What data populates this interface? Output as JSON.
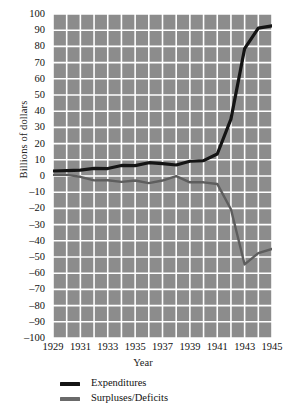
{
  "chart_data": {
    "type": "line",
    "title": "",
    "xlabel": "Year",
    "ylabel": "Billions of dollars",
    "xlim": [
      1929,
      1945
    ],
    "ylim": [
      -100,
      100
    ],
    "grid": true,
    "legend_position": "below-left",
    "background_color": "#8c8c8c",
    "gridline_color": "#ffffff",
    "x": [
      1929,
      1930,
      1931,
      1932,
      1933,
      1934,
      1935,
      1936,
      1937,
      1938,
      1939,
      1940,
      1941,
      1942,
      1943,
      1944,
      1945
    ],
    "x_tick_labels": [
      "1929",
      "1931",
      "1933",
      "1935",
      "1937",
      "1939",
      "1941",
      "1943",
      "1945"
    ],
    "x_tick_values": [
      1929,
      1931,
      1933,
      1935,
      1937,
      1939,
      1941,
      1943,
      1945
    ],
    "y_tick_labels": [
      "100",
      "90",
      "80",
      "70",
      "60",
      "50",
      "40",
      "30",
      "20",
      "10",
      "0",
      "–10",
      "–20",
      "–30",
      "–40",
      "–50",
      "–60",
      "–70",
      "–80",
      "–90",
      "–100"
    ],
    "y_tick_values": [
      100,
      90,
      80,
      70,
      60,
      50,
      40,
      30,
      20,
      10,
      0,
      -10,
      -20,
      -30,
      -40,
      -50,
      -60,
      -70,
      -80,
      -90,
      -100
    ],
    "series": [
      {
        "name": "Expenditures",
        "color": "#141414",
        "width": 3.2,
        "values": [
          3.1,
          3.3,
          3.6,
          4.7,
          4.6,
          6.5,
          6.4,
          8.2,
          7.6,
          6.8,
          9.1,
          9.5,
          13.6,
          35.1,
          78.6,
          91.3,
          92.7
        ]
      },
      {
        "name": "Surpluses/Deficits",
        "color": "#5e5e5e",
        "width": 2.4,
        "values": [
          0.7,
          0.7,
          -0.5,
          -2.7,
          -2.6,
          -3.6,
          -2.8,
          -4.4,
          -2.8,
          -0.1,
          -3.9,
          -3.9,
          -4.9,
          -20.5,
          -54.6,
          -47.6,
          -45.0
        ]
      }
    ]
  },
  "axes": {
    "y_title": "Billions of dollars",
    "x_title": "Year"
  },
  "legend": {
    "items": [
      {
        "label": "Expenditures",
        "color": "#141414"
      },
      {
        "label": "Surpluses/Deficits",
        "color": "#6a6a6a"
      }
    ]
  }
}
